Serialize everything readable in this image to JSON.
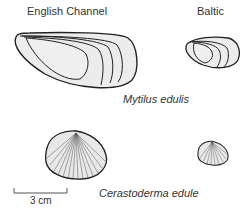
{
  "labels": {
    "region_left": "English Channel",
    "region_right": "Baltic",
    "species_1": "Mytilus edulis",
    "species_2": "Cerastoderma edule",
    "scale": "3 cm"
  },
  "colors": {
    "shell_fill": "#ececec",
    "outline": "#222222",
    "text": "#333333"
  }
}
